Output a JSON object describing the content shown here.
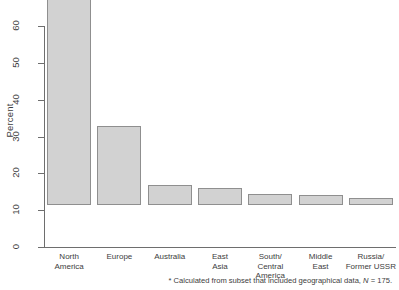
{
  "chart_data": {
    "type": "bar",
    "title": "",
    "subtitle": "",
    "xlabel": "",
    "ylabel": "Percent",
    "ylim": [
      0,
      66
    ],
    "yticks": [
      0,
      10,
      20,
      30,
      40,
      50,
      60
    ],
    "ytick_labels": [
      "0",
      "10",
      "20",
      "30",
      "40",
      "50",
      "60"
    ],
    "grid": false,
    "legend": "none",
    "bar_fill": "#d2d2d2",
    "bar_border": "#8f8f8f",
    "axis_color": "#6e6e6e",
    "categories": [
      "North America",
      "Europe",
      "Australia",
      "East Asia",
      "South/ Central America",
      "Middle East",
      "Russia/ Former USSR"
    ],
    "category_labels": [
      "North\nAmerica",
      "Europe",
      "Australia",
      "East\nAsia",
      "South/\nCentral\nAmerica",
      "Middle\nEast",
      "Russia/\nFormer USSR"
    ],
    "values": [
      64.6,
      21.4,
      5.4,
      4.6,
      3.0,
      2.7,
      2.0
    ],
    "annotations": [
      "* Calculated from subset that included geographical data, N = 175."
    ]
  },
  "footnote": {
    "prefix": "* Calculated from subset that included geographical data, ",
    "n_symbol": "N",
    "n_value": " = 175."
  },
  "axis": {
    "y_title": "Percent"
  }
}
